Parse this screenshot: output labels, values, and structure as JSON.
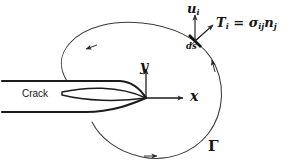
{
  "figure": {
    "background_color": "#ffffff",
    "line_color": "#3a3a3a",
    "crack_color": "#1c1c1c",
    "text_color": "#141414",
    "width": 294,
    "height": 168
  },
  "labels": {
    "displacement": {
      "symbol": "u",
      "subscript": "i",
      "text": "u"
    },
    "traction": {
      "text": "T",
      "subscript": "i",
      "equals": " = ",
      "stress_symbol": "σ",
      "stress_subscript": "ij",
      "normal_symbol": "n",
      "normal_subscript": "j",
      "full": "Tᵢ = σᵢⱼ nⱼ"
    },
    "arc_element": {
      "text": "ds"
    },
    "axis_y": {
      "text": "y"
    },
    "axis_x": {
      "text": "x"
    },
    "contour": {
      "text": "Γ"
    },
    "crack": {
      "text": "Crack"
    }
  },
  "geometry": {
    "origin": {
      "x": 146,
      "y": 98
    },
    "x_axis_end": {
      "x": 186,
      "y": 98
    },
    "y_axis_end": {
      "x": 146,
      "y": 66
    },
    "ds_point": {
      "x": 196,
      "y": 42
    },
    "contour_direction": "counterclockwise",
    "arrowheads": [
      {
        "name": "top-arrow",
        "x": 89,
        "y": 48,
        "direction": "left"
      },
      {
        "name": "right-arrow",
        "x": 213,
        "y": 62,
        "direction": "up"
      },
      {
        "name": "bottom-arrow",
        "x": 155,
        "y": 155,
        "direction": "right"
      }
    ]
  }
}
